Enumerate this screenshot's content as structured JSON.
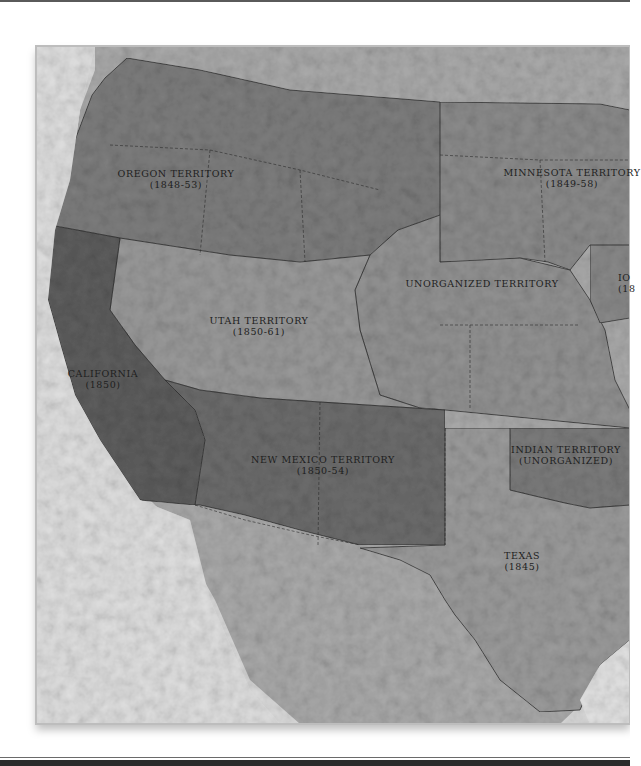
{
  "map": {
    "type": "historical territorial map",
    "palette": {
      "background": "#ffffff",
      "land": "#a8a8a8",
      "ocean": "#d9d9d9",
      "territory_light": "#8e8e8e",
      "territory_mid": "#7b7b7b",
      "territory_dark": "#5f5f5f",
      "border": "#2b2b2b",
      "label_text": "#1e1e1e"
    },
    "regions": [
      {
        "id": "oregon",
        "name": "OREGON TERRITORY",
        "dates": "(1848-53)"
      },
      {
        "id": "minnesota",
        "name": "MINNESOTA TERRITORY",
        "dates": "(1849-58)"
      },
      {
        "id": "iowa",
        "name": "IO",
        "dates": "(18"
      },
      {
        "id": "unorganized",
        "name": "UNORGANIZED TERRITORY",
        "dates": ""
      },
      {
        "id": "utah",
        "name": "UTAH TERRITORY",
        "dates": "(1850-61)"
      },
      {
        "id": "california",
        "name": "CALIFORNIA",
        "dates": "(1850)"
      },
      {
        "id": "new_mexico",
        "name": "NEW MEXICO TERRITORY",
        "dates": "(1850-54)"
      },
      {
        "id": "indian",
        "name": "INDIAN TERRITORY",
        "dates": "(UNORGANIZED)"
      },
      {
        "id": "texas",
        "name": "TEXAS",
        "dates": "(1845)"
      }
    ]
  }
}
